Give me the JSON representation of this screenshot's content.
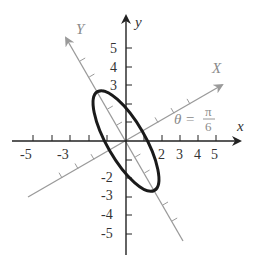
{
  "diagram": {
    "type": "rotated-axes-ellipse",
    "axes": {
      "x_label": "x",
      "y_label": "y",
      "rotated_x_label": "X",
      "rotated_y_label": "Y",
      "x_ticks": [
        "-5",
        "-3",
        "2",
        "3",
        "4",
        "5"
      ],
      "y_ticks": [
        "5",
        "4",
        "3",
        "-2",
        "-3",
        "-4",
        "-5"
      ]
    },
    "angle": {
      "theta_symbol": "θ =",
      "numerator": "π",
      "denominator": "6"
    },
    "colors": {
      "axis": "#222222",
      "rotated_axis": "#9a9a9a",
      "ellipse": "#1a1a1a"
    }
  }
}
